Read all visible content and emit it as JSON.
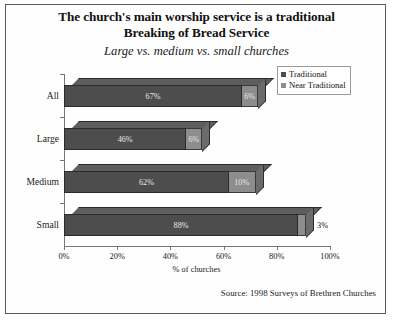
{
  "chart_data": {
    "type": "bar",
    "orientation": "horizontal",
    "stacked": true,
    "three_d": true,
    "title": "The church's main worship service is a traditional Breaking of Bread Service",
    "title_lines": [
      "The church's main worship service is a traditional",
      "Breaking of Bread Service"
    ],
    "subtitle": "Large vs. medium vs. small churches",
    "categories": [
      "All",
      "Large",
      "Medium",
      "Small"
    ],
    "series": [
      {
        "name": "Traditional",
        "color": "#4d4d4d",
        "values": [
          67,
          46,
          62,
          88
        ],
        "labels": [
          "67%",
          "46%",
          "62%",
          "88%"
        ]
      },
      {
        "name": "Near Traditional",
        "color": "#8d8d8d",
        "values": [
          6,
          6,
          10,
          3
        ],
        "labels": [
          "6%",
          "6%",
          "10%",
          "3%"
        ]
      }
    ],
    "xlabel": "% of churches",
    "ylabel": "",
    "xlim": [
      0,
      100
    ],
    "xticks": [
      0,
      20,
      40,
      60,
      80,
      100
    ],
    "xtick_labels": [
      "0%",
      "20%",
      "40%",
      "60%",
      "80%",
      "100%"
    ],
    "grid": false,
    "legend_position": "top-right",
    "source": "Source: 1998 Surveys of Brethren Churches"
  },
  "legend": {
    "entries": [
      {
        "label": "Traditional"
      },
      {
        "label": "Near Traditional"
      }
    ]
  },
  "footer": {
    "source": "Source: 1998 Surveys of Brethren Churches"
  }
}
